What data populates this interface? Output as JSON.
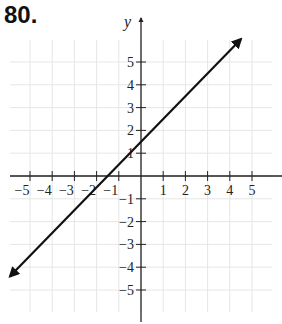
{
  "problem": {
    "number": "80."
  },
  "chart_data": {
    "type": "line",
    "title": "",
    "xlabel": "",
    "ylabel": "y",
    "xlim": [
      -5.8,
      5.8
    ],
    "ylim": [
      -6,
      6
    ],
    "grid": true,
    "x_ticks": [
      -5,
      -4,
      -3,
      -2,
      -1,
      1,
      2,
      3,
      4,
      5
    ],
    "y_ticks": [
      -5,
      -4,
      -3,
      -2,
      -1,
      1,
      2,
      3,
      4,
      5
    ],
    "x_tick_labels": [
      "−5",
      "−4",
      "−3",
      "−2",
      "−1",
      "1",
      "2",
      "3",
      "4",
      "5"
    ],
    "y_tick_labels": [
      "−5",
      "−4",
      "−3",
      "−2",
      "−1",
      "1",
      "2",
      "3",
      "4",
      "5"
    ],
    "series": [
      {
        "name": "line",
        "equation": "y = x + 1.5",
        "slope": 1,
        "intercept": 1.5,
        "x": [
          -5.9,
          4.5
        ],
        "y": [
          -4.4,
          6.0
        ],
        "arrows": "both"
      }
    ],
    "colors": {
      "line": "#111111",
      "axis": "#222222",
      "grid": "#e6e6e6"
    }
  }
}
